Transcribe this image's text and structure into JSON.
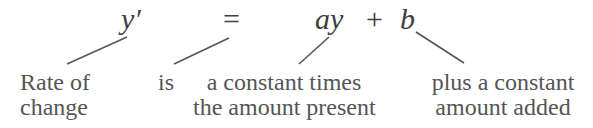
{
  "equation": {
    "lhs": "y′",
    "equals": "=",
    "term1": "ay",
    "plus": "+",
    "term2": "b"
  },
  "annotations": [
    {
      "target": "y′",
      "line1": "Rate of",
      "line2": "change"
    },
    {
      "target": "=",
      "line1": "is",
      "line2": ""
    },
    {
      "target": "ay",
      "line1": "a constant times",
      "line2": "the amount present"
    },
    {
      "target": "b",
      "line1": "plus a constant",
      "line2": "amount added"
    }
  ],
  "colors": {
    "text": "#555555",
    "lines": "#555555",
    "background": "#ffffff"
  }
}
